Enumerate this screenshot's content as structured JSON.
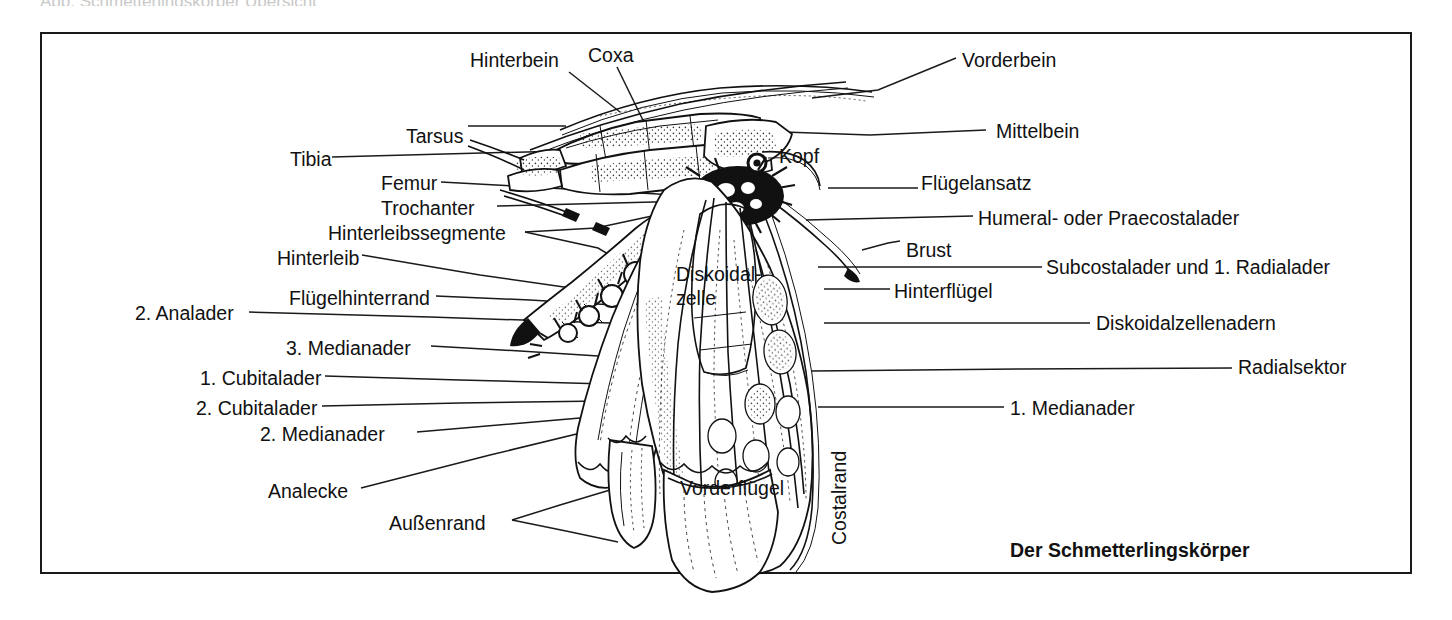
{
  "figure": {
    "caption": "Der Schmetterlingskörper",
    "frame_color": "#1a1a1a",
    "background_color": "#ffffff",
    "ink_color": "#111111"
  },
  "labels_left": [
    {
      "text": "Hinterbein",
      "x": 470,
      "y": 50
    },
    {
      "text": "Tarsus",
      "x": 406,
      "y": 126
    },
    {
      "text": "Tibia",
      "x": 290,
      "y": 149
    },
    {
      "text": "Femur",
      "x": 381,
      "y": 173
    },
    {
      "text": "Trochanter",
      "x": 381,
      "y": 198
    },
    {
      "text": "Hinterleibssegmente",
      "x": 328,
      "y": 223
    },
    {
      "text": "Hinterleib",
      "x": 277,
      "y": 248
    },
    {
      "text": "Flügelhinterrand",
      "x": 289,
      "y": 288
    },
    {
      "text": "2. Analader",
      "x": 135,
      "y": 303
    },
    {
      "text": "3. Medianader",
      "x": 286,
      "y": 338
    },
    {
      "text": "1. Cubitalader",
      "x": 200,
      "y": 368
    },
    {
      "text": "2. Cubitalader",
      "x": 196,
      "y": 398
    },
    {
      "text": "2. Medianader",
      "x": 260,
      "y": 424
    },
    {
      "text": "Analecke",
      "x": 268,
      "y": 481
    },
    {
      "text": "Außenrand",
      "x": 389,
      "y": 513
    }
  ],
  "labels_right": [
    {
      "text": "Vorderbein",
      "x": 962,
      "y": 50
    },
    {
      "text": "Mittelbein",
      "x": 996,
      "y": 121
    },
    {
      "text": "Flügelansatz",
      "x": 921,
      "y": 173
    },
    {
      "text": "Humeral- oder Praecostalader",
      "x": 978,
      "y": 208
    },
    {
      "text": "Brust",
      "x": 906,
      "y": 240
    },
    {
      "text": "Subcostalader und 1. Radialader",
      "x": 1046,
      "y": 257
    },
    {
      "text": "Hinterflügel",
      "x": 894,
      "y": 281
    },
    {
      "text": "Diskoidalzellenadern",
      "x": 1096,
      "y": 313
    },
    {
      "text": "Radialsektor",
      "x": 1238,
      "y": 357
    },
    {
      "text": "1. Medianader",
      "x": 1010,
      "y": 398
    }
  ],
  "labels_center": [
    {
      "text": "Coxa",
      "x": 588,
      "y": 45
    },
    {
      "text": "Kopf",
      "x": 779,
      "y": 146
    },
    {
      "text": "Diskoidal-",
      "x": 676,
      "y": 264
    },
    {
      "text": "zelle",
      "x": 676,
      "y": 288
    },
    {
      "text": "Vorderflügel",
      "x": 680,
      "y": 478
    }
  ],
  "labels_rotated": [
    {
      "text": "Costalrand",
      "x": 828,
      "y": 545
    }
  ],
  "leader_lines": [
    {
      "name": "hinterbein",
      "points": "569,72 620,112"
    },
    {
      "name": "coxa",
      "points": "617,67 672,182"
    },
    {
      "name": "vorderbein",
      "points": "880,92 958,58"
    },
    {
      "name": "tarsus",
      "points": "468,126 566,126"
    },
    {
      "name": "tibia",
      "points": "332,156 592,156"
    },
    {
      "name": "mittelbein",
      "points": "723,128 988,129"
    },
    {
      "name": "femur",
      "points": "441,181 691,195"
    },
    {
      "name": "kopf",
      "points": "757,152 772,152"
    },
    {
      "name": "trochanter",
      "points": "496,205 689,200"
    },
    {
      "name": "fluegelansatz",
      "points": "823,186 916,186"
    },
    {
      "name": "hinterleibssegmente1",
      "points": "524,231 648,218"
    },
    {
      "name": "hinterleibssegmente2",
      "points": "524,231 622,262"
    },
    {
      "name": "humeral",
      "points": "805,218 975,215"
    },
    {
      "name": "brust",
      "points": "862,248 902,240"
    },
    {
      "name": "hinterleib",
      "points": "361,254 590,290"
    },
    {
      "name": "subcostalader",
      "points": "817,266 1043,266"
    },
    {
      "name": "hinterfluegel",
      "points": "824,288 890,288"
    },
    {
      "name": "fluegelhinterrand",
      "points": "435,295 612,303"
    },
    {
      "name": "analader2",
      "points": "248,311 608,322"
    },
    {
      "name": "diskoidalzellenadern",
      "points": "824,322 1092,322"
    },
    {
      "name": "medianader3",
      "points": "430,345 612,356"
    },
    {
      "name": "radialsektor",
      "points": "812,370 1234,367"
    },
    {
      "name": "cubitalader1",
      "points": "324,375 604,383"
    },
    {
      "name": "cubitalader2",
      "points": "321,405 600,400"
    },
    {
      "name": "medianader1",
      "points": "816,406 1006,406"
    },
    {
      "name": "medianader2",
      "points": "416,431 750,406"
    },
    {
      "name": "analecke",
      "points": "360,487 620,422"
    },
    {
      "name": "aussenrand1",
      "points": "510,519 608,489"
    },
    {
      "name": "aussenrand2",
      "points": "510,519 616,541"
    }
  ],
  "smudge_top": "Abb. Schmetterlingskörper Übersicht"
}
